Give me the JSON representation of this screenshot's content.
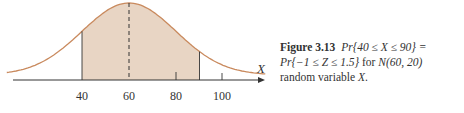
{
  "chart_data": {
    "type": "area",
    "title": "",
    "distribution": "Normal N(60, 20)",
    "mean": 60,
    "sd": 20,
    "shaded_interval": [
      40,
      90
    ],
    "xlabel": "X",
    "ylabel": "",
    "x_ticks": [
      40,
      60,
      80,
      100
    ],
    "x_range": [
      8,
      118
    ],
    "mean_line": "dashed vertical at 60",
    "grid": false,
    "legend": null
  },
  "figure": {
    "axis_label": "X",
    "tick_labels": [
      "40",
      "60",
      "80",
      "100"
    ]
  },
  "caption": {
    "label": "Figure 3.13",
    "line1": "Pr{40 ≤ X ≤ 90} =",
    "line2": "Pr{−1 ≤ Z ≤ 1.5}",
    "line2b": " for ",
    "line2c": "N(60, 20)",
    "line3a": "random variable ",
    "line3b": "X",
    "line3c": "."
  },
  "colors": {
    "curve": "#c98a5e",
    "fill": "#e8d5c4",
    "axis": "#333333"
  }
}
